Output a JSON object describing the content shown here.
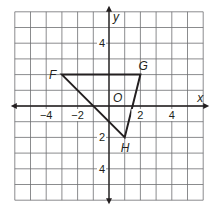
{
  "figure": {
    "type": "coordinate-plane",
    "grid": {
      "x_min": -6,
      "x_max": 6,
      "y_min": -6,
      "y_max": 6,
      "unit": 1
    },
    "axes": {
      "x_label": "x",
      "y_label": "y",
      "origin_label": "O"
    },
    "x_ticks": [
      {
        "value": -4,
        "label": "−4"
      },
      {
        "value": -2,
        "label": "−2"
      },
      {
        "value": 2,
        "label": "2"
      },
      {
        "value": 4,
        "label": "4"
      }
    ],
    "y_ticks": [
      {
        "value": 4,
        "label": "4"
      },
      {
        "value": -2,
        "label": "2"
      },
      {
        "value": -4,
        "label": "4"
      }
    ],
    "triangle": {
      "vertices": [
        {
          "name": "F",
          "x": -3,
          "y": 2
        },
        {
          "name": "G",
          "x": 2,
          "y": 2
        },
        {
          "name": "H",
          "x": 1,
          "y": -2
        }
      ]
    },
    "colors": {
      "grid": "#6d6e71",
      "line": "#231f20",
      "background": "#ffffff"
    }
  }
}
